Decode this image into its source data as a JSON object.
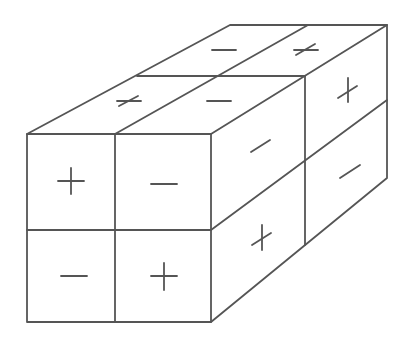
{
  "diagram": {
    "type": "isometric-box-2x2x2",
    "colors": {
      "line": "#555555",
      "background": "#ffffff"
    },
    "front_face": {
      "cells": [
        {
          "row": 0,
          "col": 0,
          "sign": "+"
        },
        {
          "row": 0,
          "col": 1,
          "sign": "-"
        },
        {
          "row": 1,
          "col": 0,
          "sign": "-"
        },
        {
          "row": 1,
          "col": 1,
          "sign": "+"
        }
      ]
    },
    "top_face": {
      "cells": [
        {
          "depth": "front",
          "col": 0,
          "sign": "+"
        },
        {
          "depth": "front",
          "col": 1,
          "sign": "-"
        },
        {
          "depth": "back",
          "col": 0,
          "sign": "-"
        },
        {
          "depth": "back",
          "col": 1,
          "sign": "+"
        }
      ]
    },
    "right_face": {
      "cells": [
        {
          "row": 0,
          "depth": "front",
          "sign": "-"
        },
        {
          "row": 0,
          "depth": "back",
          "sign": "+"
        },
        {
          "row": 1,
          "depth": "front",
          "sign": "+"
        },
        {
          "row": 1,
          "depth": "back",
          "sign": "-"
        }
      ]
    }
  }
}
